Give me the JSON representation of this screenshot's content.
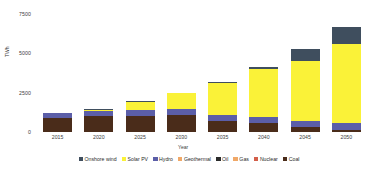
{
  "chart_data": {
    "type": "bar",
    "stacked": true,
    "title": "",
    "xlabel": "Year",
    "ylabel": "TWh",
    "categories": [
      "2015",
      "2020",
      "2025",
      "2030",
      "2035",
      "2040",
      "2045",
      "2050"
    ],
    "ylim": [
      0,
      7500
    ],
    "yticks": [
      0,
      2500,
      5000,
      7500
    ],
    "ytick_labels": [
      "0",
      "2500",
      "5000",
      "7500"
    ],
    "grid": false,
    "legend_position": "bottom",
    "series": [
      {
        "name": "Coal",
        "color": "#4a2c1a",
        "values": [
          880,
          1010,
          1040,
          1090,
          690,
          560,
          300,
          140
        ]
      },
      {
        "name": "Nuclear",
        "color": "#d35f4a",
        "values": [
          0,
          0,
          0,
          0,
          0,
          0,
          0,
          0
        ]
      },
      {
        "name": "Gas",
        "color": "#f0a868",
        "values": [
          0,
          0,
          0,
          0,
          0,
          0,
          0,
          0
        ]
      },
      {
        "name": "Oil",
        "color": "#2b2b2b",
        "values": [
          0,
          0,
          0,
          0,
          0,
          0,
          0,
          0
        ]
      },
      {
        "name": "Geothermal",
        "color": "#f0a868",
        "values": [
          0,
          0,
          0,
          0,
          0,
          0,
          0,
          0
        ]
      },
      {
        "name": "Hydro",
        "color": "#5b5ea8",
        "values": [
          330,
          330,
          350,
          360,
          370,
          400,
          430,
          460
        ]
      },
      {
        "name": "Solar PV",
        "color": "#faf238",
        "values": [
          0,
          90,
          540,
          1000,
          2060,
          3060,
          3760,
          4990
        ]
      },
      {
        "name": "Onshore wind",
        "color": "#3f4e5e",
        "values": [
          0,
          30,
          20,
          30,
          60,
          120,
          770,
          1080
        ]
      }
    ],
    "legend_entries": [
      {
        "label": "Onshore wind",
        "color": "#3f4e5e"
      },
      {
        "label": "Solar PV",
        "color": "#faf238"
      },
      {
        "label": "Hydro",
        "color": "#5b5ea8"
      },
      {
        "label": "Geothermal",
        "color": "#f0a868"
      },
      {
        "label": "Oil",
        "color": "#2b2b2b"
      },
      {
        "label": "Gas",
        "color": "#f0a868"
      },
      {
        "label": "Nuclear",
        "color": "#d35f4a"
      },
      {
        "label": "Coal",
        "color": "#4a2c1a"
      }
    ],
    "totals": [
      1210,
      1460,
      1950,
      2480,
      3180,
      4140,
      5260,
      6670
    ]
  }
}
